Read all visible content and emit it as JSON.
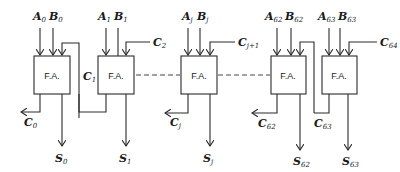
{
  "diagram": {
    "block_label": "F.A.",
    "stages": [
      {
        "id": "0",
        "a": "A",
        "a_sub": "0",
        "b": "B",
        "b_sub": "0",
        "sum": "S",
        "sum_sub": "0"
      },
      {
        "id": "1",
        "a": "A",
        "a_sub": "1",
        "b": "B",
        "b_sub": "1",
        "sum": "S",
        "sum_sub": "1"
      },
      {
        "id": "j",
        "a": "A",
        "a_sub": "j",
        "b": "B",
        "b_sub": "j",
        "sum": "S",
        "sum_sub": "j"
      },
      {
        "id": "62",
        "a": "A",
        "a_sub": "62",
        "b": "B",
        "b_sub": "62",
        "sum": "S",
        "sum_sub": "62"
      },
      {
        "id": "63",
        "a": "A",
        "a_sub": "63",
        "b": "B",
        "b_sub": "63",
        "sum": "S",
        "sum_sub": "63"
      }
    ],
    "carries": {
      "c0": {
        "base": "C",
        "sub": "0"
      },
      "c1": {
        "base": "C",
        "sub": "1"
      },
      "c2": {
        "base": "C",
        "sub": "2"
      },
      "cj": {
        "base": "C",
        "sub": "j"
      },
      "cj1": {
        "base": "C",
        "sub": "j+1"
      },
      "c62": {
        "base": "C",
        "sub": "62"
      },
      "c63": {
        "base": "C",
        "sub": "63"
      },
      "c64": {
        "base": "C",
        "sub": "64"
      }
    },
    "colors": {
      "line": "#2a2a2a",
      "background": "#ffffff"
    }
  }
}
